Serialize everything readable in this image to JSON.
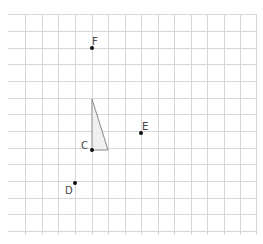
{
  "diagram": {
    "type": "grid-with-points",
    "grid": {
      "x_lines": [
        8,
        25,
        42,
        58,
        75,
        92,
        108,
        125,
        141,
        158,
        174,
        191,
        207,
        224,
        240,
        256
      ],
      "y_lines": [
        14,
        31,
        48,
        64,
        81,
        98,
        114,
        131,
        148,
        164,
        181,
        198,
        214,
        231
      ],
      "line_color": "#d6d6d6"
    },
    "points": [
      {
        "name": "F",
        "x": 92,
        "y": 48,
        "label_x": 92,
        "label_y": 37
      },
      {
        "name": "E",
        "x": 141,
        "y": 133,
        "label_x": 142,
        "label_y": 122
      },
      {
        "name": "C",
        "x": 92,
        "y": 150,
        "label_x": 81,
        "label_y": 141
      },
      {
        "name": "D",
        "x": 75,
        "y": 183,
        "label_x": 65,
        "label_y": 186
      }
    ],
    "triangle": {
      "vertices": [
        [
          92,
          99
        ],
        [
          92,
          150
        ],
        [
          108,
          150
        ]
      ],
      "fill": "#f0f0f0",
      "stroke": "#888888"
    }
  }
}
